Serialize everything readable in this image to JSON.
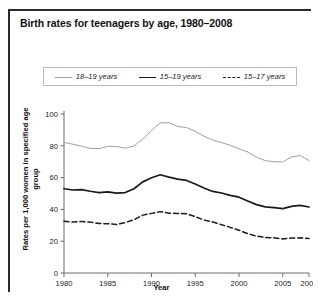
{
  "figure": {
    "title": "Birth rates for teenagers by age, 1980–2008",
    "source_note": ""
  },
  "legend": {
    "position": "top-center",
    "entries": [
      {
        "label": "18–19 years",
        "style": "thin-solid",
        "color": "#a0a0a0"
      },
      {
        "label": "15–19 years",
        "style": "thick-solid",
        "color": "#1a1a1a"
      },
      {
        "label": "15–17 years",
        "style": "dashed",
        "color": "#1a1a1a"
      }
    ]
  },
  "chart_data": {
    "type": "line",
    "title": "Birth rates for teenagers by age, 1980–2008",
    "xlabel": "Year",
    "ylabel": "Rates per 1,000 women in specified age group",
    "xlim": [
      1980,
      2008
    ],
    "ylim": [
      0,
      100
    ],
    "grid": false,
    "legend_position": "top-center",
    "xticks": [
      1980,
      1985,
      1990,
      1995,
      2000,
      2005,
      2008
    ],
    "xticklabels": [
      "1980",
      "1985",
      "1990",
      "1995",
      "2000",
      "2005",
      "2008"
    ],
    "yticks": [
      0,
      20,
      40,
      60,
      80,
      100
    ],
    "yticklabels": [
      "0",
      "20",
      "40",
      "60",
      "80",
      "100"
    ],
    "x": [
      1980,
      1981,
      1982,
      1983,
      1984,
      1985,
      1986,
      1987,
      1988,
      1989,
      1990,
      1991,
      1992,
      1993,
      1994,
      1995,
      1996,
      1997,
      1998,
      1999,
      2000,
      2001,
      2002,
      2003,
      2004,
      2005,
      2006,
      2007,
      2008
    ],
    "series": [
      {
        "name": "18–19 years",
        "color": "#a0a0a0",
        "style": "thin-solid",
        "values": [
          82.1,
          81.0,
          79.8,
          78.4,
          78.2,
          79.6,
          79.6,
          78.5,
          79.9,
          84.2,
          89.6,
          94.4,
          94.5,
          92.1,
          91.5,
          89.1,
          86.0,
          83.6,
          82.0,
          80.3,
          78.1,
          76.1,
          72.8,
          70.7,
          70.0,
          69.9,
          73.0,
          73.9,
          70.7
        ]
      },
      {
        "name": "15–19 years",
        "color": "#1a1a1a",
        "style": "thick-solid",
        "values": [
          53.0,
          52.2,
          52.4,
          51.4,
          50.6,
          51.0,
          50.2,
          50.6,
          53.0,
          57.3,
          59.9,
          61.8,
          60.3,
          59.0,
          58.2,
          56.0,
          53.5,
          51.3,
          50.3,
          48.8,
          47.7,
          45.3,
          43.0,
          41.6,
          41.1,
          40.5,
          41.9,
          42.5,
          41.5
        ]
      },
      {
        "name": "15–17 years",
        "color": "#1a1a1a",
        "style": "dashed",
        "values": [
          32.5,
          32.0,
          32.4,
          32.0,
          31.1,
          31.0,
          30.5,
          31.7,
          33.6,
          36.4,
          37.5,
          38.6,
          37.6,
          37.5,
          37.2,
          35.5,
          33.3,
          32.1,
          30.4,
          28.7,
          26.9,
          24.7,
          23.2,
          22.4,
          22.1,
          21.4,
          22.0,
          22.1,
          21.7
        ]
      }
    ]
  }
}
